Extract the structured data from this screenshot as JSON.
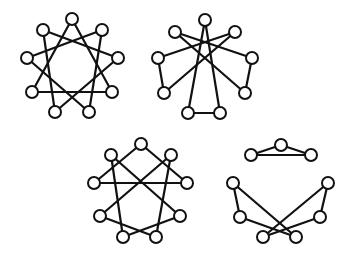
{
  "diagram": {
    "node_radius": 6,
    "stroke_color": "#111111",
    "fill_color": "#ffffff",
    "graphs": [
      {
        "id": "graph-1",
        "nodes": [
          {
            "id": "top",
            "x": 72,
            "y": 19
          },
          {
            "id": "upper-right",
            "x": 102,
            "y": 30
          },
          {
            "id": "right",
            "x": 118,
            "y": 58
          },
          {
            "id": "lower-right",
            "x": 112,
            "y": 92
          },
          {
            "id": "bottom-right",
            "x": 89,
            "y": 112
          },
          {
            "id": "bottom-left",
            "x": 55,
            "y": 112
          },
          {
            "id": "lower-left",
            "x": 32,
            "y": 92
          },
          {
            "id": "left",
            "x": 27,
            "y": 58
          },
          {
            "id": "upper-left",
            "x": 43,
            "y": 30
          }
        ],
        "edges": [
          [
            "top",
            "lower-right"
          ],
          [
            "lower-right",
            "lower-left"
          ],
          [
            "lower-left",
            "top"
          ],
          [
            "upper-right",
            "bottom-right"
          ],
          [
            "bottom-right",
            "left"
          ],
          [
            "left",
            "upper-right"
          ],
          [
            "right",
            "bottom-left"
          ],
          [
            "bottom-left",
            "upper-left"
          ],
          [
            "upper-left",
            "right"
          ]
        ]
      },
      {
        "id": "graph-2",
        "nodes": [
          {
            "id": "top",
            "x": 205,
            "y": 20
          },
          {
            "id": "upper-left",
            "x": 175,
            "y": 32
          },
          {
            "id": "upper-right",
            "x": 235,
            "y": 32
          },
          {
            "id": "left",
            "x": 158,
            "y": 58
          },
          {
            "id": "right",
            "x": 252,
            "y": 58
          },
          {
            "id": "lower-left",
            "x": 164,
            "y": 93
          },
          {
            "id": "lower-right",
            "x": 245,
            "y": 93
          },
          {
            "id": "bottom-left",
            "x": 188,
            "y": 113
          },
          {
            "id": "bottom-right",
            "x": 220,
            "y": 113
          }
        ],
        "edges": [
          [
            "left",
            "lower-left"
          ],
          [
            "right",
            "lower-right"
          ],
          [
            "bottom-left",
            "bottom-right"
          ],
          [
            "top",
            "bottom-left"
          ],
          [
            "top",
            "bottom-right"
          ],
          [
            "upper-left",
            "right"
          ],
          [
            "upper-right",
            "left"
          ],
          [
            "upper-left",
            "lower-right"
          ],
          [
            "upper-right",
            "lower-left"
          ]
        ]
      },
      {
        "id": "graph-3",
        "nodes": [
          {
            "id": "top",
            "x": 141,
            "y": 144
          },
          {
            "id": "upper-left",
            "x": 111,
            "y": 155
          },
          {
            "id": "upper-right",
            "x": 171,
            "y": 155
          },
          {
            "id": "left",
            "x": 94,
            "y": 183
          },
          {
            "id": "right",
            "x": 187,
            "y": 183
          },
          {
            "id": "lower-left",
            "x": 100,
            "y": 216
          },
          {
            "id": "lower-right",
            "x": 180,
            "y": 216
          },
          {
            "id": "bottom-left",
            "x": 123,
            "y": 237
          },
          {
            "id": "bottom-right",
            "x": 156,
            "y": 237
          }
        ],
        "edges": [
          [
            "top",
            "left"
          ],
          [
            "top",
            "right"
          ],
          [
            "left",
            "right"
          ],
          [
            "upper-left",
            "bottom-left"
          ],
          [
            "upper-right",
            "bottom-right"
          ],
          [
            "upper-left",
            "lower-right"
          ],
          [
            "upper-right",
            "lower-left"
          ],
          [
            "lower-left",
            "bottom-right"
          ],
          [
            "lower-right",
            "bottom-left"
          ]
        ]
      },
      {
        "id": "graph-4",
        "nodes": [
          {
            "id": "top",
            "x": 281,
            "y": 145
          },
          {
            "id": "upper-left",
            "x": 251,
            "y": 155
          },
          {
            "id": "upper-right",
            "x": 311,
            "y": 155
          },
          {
            "id": "left",
            "x": 233,
            "y": 183
          },
          {
            "id": "right",
            "x": 328,
            "y": 183
          },
          {
            "id": "lower-left",
            "x": 240,
            "y": 217
          },
          {
            "id": "lower-right",
            "x": 320,
            "y": 217
          },
          {
            "id": "bottom-left",
            "x": 263,
            "y": 237
          },
          {
            "id": "bottom-right",
            "x": 296,
            "y": 237
          }
        ],
        "edges": [
          [
            "top",
            "upper-left"
          ],
          [
            "top",
            "upper-right"
          ],
          [
            "upper-left",
            "upper-right"
          ],
          [
            "left",
            "lower-left"
          ],
          [
            "left",
            "bottom-right"
          ],
          [
            "right",
            "lower-right"
          ],
          [
            "right",
            "bottom-left"
          ],
          [
            "lower-left",
            "bottom-right"
          ],
          [
            "lower-right",
            "bottom-left"
          ]
        ]
      }
    ]
  }
}
